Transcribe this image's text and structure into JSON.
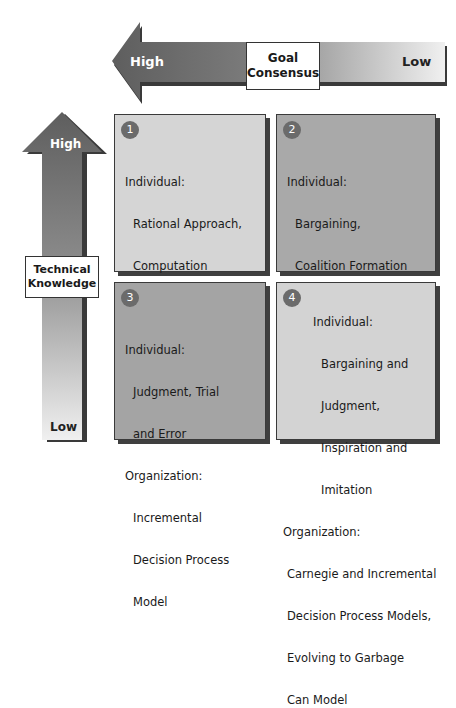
{
  "goal_axis": {
    "title_line1": "Goal",
    "title_line2": "Consensus",
    "high_label": "High",
    "low_label": "Low"
  },
  "tech_axis": {
    "title_line1": "Technical",
    "title_line2": "Knowledge",
    "high_label": "High",
    "low_label": "Low"
  },
  "quadrants": [
    {
      "number": "1",
      "individual_label": "Individual:",
      "individual_items": [
        "Rational Approach,",
        "Computation"
      ],
      "organization_label": "Organization:",
      "organization_items": [
        "Management",
        "Science"
      ],
      "color": "#d5d5d5"
    },
    {
      "number": "2",
      "individual_label": "Individual:",
      "individual_items": [
        "Bargaining,",
        "Coalition Formation"
      ],
      "organization_label": "Organization:",
      "organization_items": [
        "Carnegie Model"
      ],
      "color": "#a9a9a9"
    },
    {
      "number": "3",
      "individual_label": "Individual:",
      "individual_items": [
        "Judgment, Trial",
        "and Error"
      ],
      "organization_label": "Organization:",
      "organization_items": [
        "Incremental",
        "Decision Process",
        "Model"
      ],
      "color": "#a4a4a4"
    },
    {
      "number": "4",
      "individual_label": "Individual:",
      "individual_items": [
        "Bargaining and",
        "Judgment,",
        "Inspiration and",
        "Imitation"
      ],
      "organization_label": "Organization:",
      "organization_items": [
        "Carnegie and Incremental",
        "Decision Process Models,",
        "Evolving to Garbage",
        "Can Model"
      ],
      "color": "#d3d3d3"
    }
  ]
}
